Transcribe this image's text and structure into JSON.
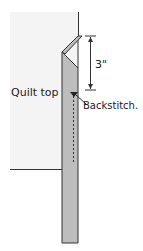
{
  "diagram": {
    "labels": {
      "quilt_top": "Quilt top",
      "measurement": "3\"",
      "backstitch": "Backstitch."
    },
    "colors": {
      "quilt_top_fill": "#f4f4f4",
      "binding_fill": "#bdbdbd",
      "outline": "#333333"
    }
  }
}
